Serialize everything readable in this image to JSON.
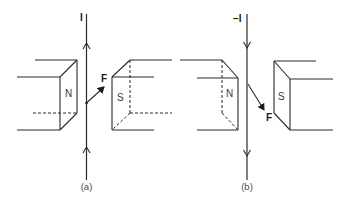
{
  "figure": {
    "panels": [
      {
        "caption": "(a)",
        "current_label": "I",
        "current_direction": "up",
        "force_label": "F",
        "force_direction": "up-right",
        "left_pole": "N",
        "right_pole": "S"
      },
      {
        "caption": "(b)",
        "current_label": "−I",
        "current_direction": "down",
        "force_label": "F",
        "force_direction": "down-right",
        "left_pole": "N",
        "right_pole": "S"
      }
    ],
    "colors": {
      "line": "#2a2a2a",
      "background": "#ffffff"
    }
  }
}
